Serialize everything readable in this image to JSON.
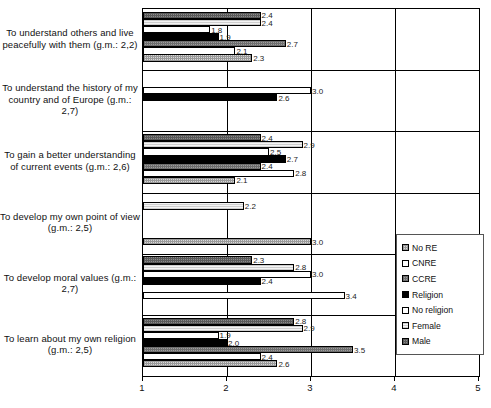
{
  "chart_data": {
    "type": "bar",
    "orientation": "horizontal",
    "title": "",
    "xlabel": "",
    "ylabel": "",
    "xlim": [
      1,
      5
    ],
    "xticks": [
      "1",
      "2",
      "3",
      "4",
      "5"
    ],
    "grid": true,
    "legend_position": "right",
    "series_order_legend": [
      "No RE",
      "CNRE",
      "CCRE",
      "Religion",
      "No religion",
      "Female",
      "Male"
    ],
    "categories": [
      "To understand others and live peacefully with them (g.m.: 2,2)",
      "To understand the history of my country and of Europe (g.m.: 2,7)",
      "To gain a better understanding of current events (g.m.: 2,6)",
      "To develop my own point of view (g.m.: 2,5)",
      "To develop moral values (g.m.: 2,7)",
      "To learn about my own religion (g.m.: 2,5)"
    ],
    "series": [
      {
        "name": "No RE",
        "values": [
          2.3,
          null,
          3.0,
          3.0,
          null,
          2.6
        ]
      },
      {
        "name": "CNRE",
        "values": [
          2.1,
          null,
          2.2,
          null,
          3.4,
          2.4
        ]
      },
      {
        "name": "CCRE",
        "values": [
          2.7,
          null,
          2.8,
          null,
          2.4,
          3.5
        ]
      },
      {
        "name": "Religion",
        "values": [
          1.9,
          2.6,
          2.4,
          2.1,
          3.0,
          2.0
        ]
      },
      {
        "name": "No religion",
        "values": [
          1.8,
          3.0,
          2.7,
          2.4,
          2.8,
          1.9
        ]
      },
      {
        "name": "Female",
        "values": [
          2.4,
          null,
          2.5,
          2.8,
          2.3,
          2.9
        ]
      },
      {
        "name": "Male",
        "values": [
          2.4,
          null,
          2.4,
          2.9,
          null,
          2.8
        ]
      }
    ],
    "data_labels": {
      "group_1": [
        "2.4",
        "2.4",
        "1.8",
        "1.9",
        "2.7",
        "2.1",
        "2.3"
      ],
      "group_2": [
        "2.6",
        "3.0"
      ],
      "group_3": [
        "2.4",
        "2.9",
        "2.5",
        "2.7",
        "2.4",
        "2.8",
        "2.1",
        "2.2",
        "3.0"
      ],
      "group_5": [
        "2.3",
        "2.8",
        "3.0",
        "2.4",
        "3.4"
      ],
      "group_6": [
        "2.8",
        "2.9",
        "1.9",
        "2.0",
        "3.5",
        "2.4",
        "2.6"
      ]
    }
  },
  "legend": {
    "items": [
      {
        "label": "No RE",
        "pattern": "nore",
        "color": "#d8d8d8"
      },
      {
        "label": "CNRE",
        "pattern": "cnre",
        "color": "#ffffff"
      },
      {
        "label": "CCRE",
        "pattern": "ccre",
        "color": "#9d9d9d"
      },
      {
        "label": "Religion",
        "pattern": "religion",
        "color": "#000000"
      },
      {
        "label": "No religion",
        "pattern": "norelig",
        "color": "#ffffff"
      },
      {
        "label": "Female",
        "pattern": "female",
        "color": "#e8e8e8"
      },
      {
        "label": "Male",
        "pattern": "male",
        "color": "#8a8a8a"
      }
    ]
  },
  "axis": {
    "x_tick_labels": [
      "1",
      "2",
      "3",
      "4",
      "5"
    ]
  },
  "category_labels": [
    "To understand others and live peacefully with them (g.m.: 2,2)",
    "To understand the history of my country and of Europe (g.m.: 2,7)",
    "To gain a better understanding of current events (g.m.: 2,6)",
    "To develop my own point of view (g.m.: 2,5)",
    "To develop moral values (g.m.: 2,7)",
    "To learn about my own religion (g.m.: 2,5)"
  ],
  "bars": [
    {
      "group": 0,
      "series": "Male",
      "value": 2.4,
      "label": "2.4"
    },
    {
      "group": 0,
      "series": "Female",
      "value": 2.4,
      "label": "2.4"
    },
    {
      "group": 0,
      "series": "No religion",
      "value": 1.8,
      "label": "1.8"
    },
    {
      "group": 0,
      "series": "Religion",
      "value": 1.9,
      "label": "1.9"
    },
    {
      "group": 0,
      "series": "CCRE",
      "value": 2.7,
      "label": "2.7"
    },
    {
      "group": 0,
      "series": "CNRE",
      "value": 2.1,
      "label": "2.1"
    },
    {
      "group": 0,
      "series": "No RE",
      "value": 2.3,
      "label": "2.3"
    },
    {
      "group": 1,
      "series": "Religion",
      "value": 2.6,
      "label": "2.6"
    },
    {
      "group": 1,
      "series": "No religion",
      "value": 3.0,
      "label": "3.0"
    },
    {
      "group": 2,
      "series": "Male",
      "value": 2.4,
      "label": "2.4"
    },
    {
      "group": 2,
      "series": "Female",
      "value": 2.9,
      "label": "2.9"
    },
    {
      "group": 2,
      "series": "No religion",
      "value": 2.5,
      "label": "2.5"
    },
    {
      "group": 2,
      "series": "Religion",
      "value": 2.7,
      "label": "2.7"
    },
    {
      "group": 2,
      "series": "CCRE",
      "value": 2.4,
      "label": "2.4"
    },
    {
      "group": 2,
      "series": "CNRE",
      "value": 2.8,
      "label": "2.8"
    },
    {
      "group": 2,
      "series": "No RE",
      "value": 2.1,
      "label": "2.1"
    },
    {
      "group": 3,
      "series": "Female",
      "value": 2.2,
      "label": "2.2"
    },
    {
      "group": 3,
      "series": "No RE",
      "value": 3.0,
      "label": "3.0"
    },
    {
      "group": 4,
      "series": "Male",
      "value": 2.3,
      "label": "2.3"
    },
    {
      "group": 4,
      "series": "Female",
      "value": 2.8,
      "label": "2.8"
    },
    {
      "group": 4,
      "series": "No religion",
      "value": 3.0,
      "label": "3.0"
    },
    {
      "group": 4,
      "series": "Religion",
      "value": 2.4,
      "label": "2.4"
    },
    {
      "group": 4,
      "series": "CNRE",
      "value": 3.4,
      "label": "3.4"
    },
    {
      "group": 5,
      "series": "Male",
      "value": 2.8,
      "label": "2.8"
    },
    {
      "group": 5,
      "series": "Female",
      "value": 2.9,
      "label": "2.9"
    },
    {
      "group": 5,
      "series": "No religion",
      "value": 1.9,
      "label": "1.9"
    },
    {
      "group": 5,
      "series": "Religion",
      "value": 2.0,
      "label": "2.0"
    },
    {
      "group": 5,
      "series": "CCRE",
      "value": 3.5,
      "label": "3.5"
    },
    {
      "group": 5,
      "series": "CNRE",
      "value": 2.4,
      "label": "2.4"
    },
    {
      "group": 5,
      "series": "No RE",
      "value": 2.6,
      "label": "2.6"
    }
  ]
}
